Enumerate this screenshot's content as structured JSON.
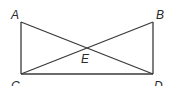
{
  "diagram": {
    "points": {
      "A": {
        "label": "A",
        "x": 21,
        "y": 22,
        "lx": 11,
        "ly": 19
      },
      "B": {
        "label": "B",
        "x": 153,
        "y": 22,
        "lx": 156,
        "ly": 19
      },
      "C": {
        "label": "C",
        "x": 21,
        "y": 74,
        "lx": 11,
        "ly": 90
      },
      "D": {
        "label": "D",
        "x": 153,
        "y": 74,
        "lx": 154,
        "ly": 90
      },
      "E": {
        "label": "E",
        "x": 87,
        "y": 48,
        "lx": 81,
        "ly": 63
      }
    },
    "segments": [
      [
        "A",
        "C"
      ],
      [
        "B",
        "D"
      ],
      [
        "C",
        "D"
      ],
      [
        "A",
        "D"
      ],
      [
        "B",
        "C"
      ]
    ]
  }
}
